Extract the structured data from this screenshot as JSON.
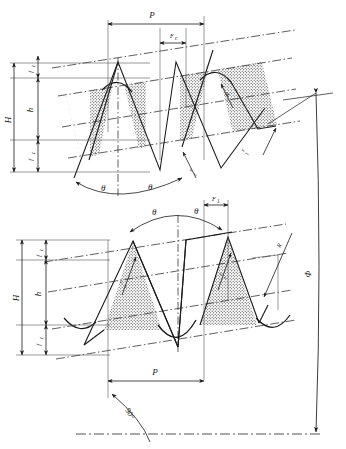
{
  "drawing": {
    "title": "Thread profile cross-section engineering drawing",
    "type": "technical-line-drawing",
    "background": "#ffffff",
    "line_color": "#1a1a1a",
    "hatch_color": "#3a3a3a",
    "figures": [
      {
        "id": "upper-figure",
        "name": "upper-thread-profile",
        "description": "Inclined parallelogram band with stippled fill and triangular thread teeth",
        "labels": {
          "pitch": "P",
          "flank_top": "F",
          "flank_top_sub": "c",
          "flank_bottom": "F",
          "flank_bottom_sub": "1",
          "total_height": "H",
          "crest_clearance_top": "f",
          "crest_clearance_top_sub": "c",
          "working_height": "h",
          "crest_clearance_bottom": "f",
          "crest_clearance_bottom_sub": "c",
          "flank_angle_left": "θ",
          "flank_angle_right": "θ",
          "crest_radius": "R",
          "root_radius": "r",
          "root_radius_sub": "c",
          "tooth_radius": "r",
          "tooth_radius_sub": "1"
        }
      },
      {
        "id": "lower-figure",
        "name": "lower-thread-profile",
        "description": "Inclined parallelogram band with stippled triangular teeth, inverted root curves",
        "labels": {
          "pitch": "P",
          "flank_top": "F",
          "flank_top_sub": "1",
          "total_height": "H",
          "crest_clearance_top": "f",
          "crest_clearance_top_sub": "c",
          "working_height": "h",
          "crest_clearance_bottom": "f",
          "crest_clearance_bottom_sub": "c",
          "flank_angle_left": "θ",
          "flank_angle_right": "θ",
          "crest_radius": "R",
          "root_radius_left": "r",
          "root_radius_left_sub": "c",
          "root_radius_right": "r",
          "root_radius_right_sub": "1",
          "lead_angle": "90°"
        }
      }
    ],
    "overall": {
      "diameter_symbol": "Φ",
      "axis_line": "center-axis-dash-dot"
    }
  }
}
